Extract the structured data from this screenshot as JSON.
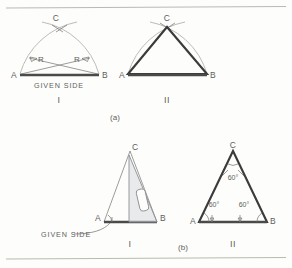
{
  "figure": {
    "title_part_a": "(a)",
    "title_part_b": "(b)",
    "panels": [
      {
        "id": "a-I",
        "roman": "I",
        "points": {
          "a": "A",
          "b": "B",
          "c": "C"
        },
        "radius_left": "R",
        "radius_right": "R",
        "caption": "GIVEN  SIDE"
      },
      {
        "id": "a-II",
        "roman": "II",
        "points": {
          "a": "A",
          "b": "B",
          "c": "C"
        }
      },
      {
        "id": "b-I",
        "roman": "I",
        "points": {
          "a": "A",
          "b": "B",
          "c": "C"
        },
        "caption": "GIVEN  SIDE"
      },
      {
        "id": "b-II",
        "roman": "II",
        "points": {
          "a": "A",
          "b": "B",
          "c": "C"
        },
        "angles": [
          "60°",
          "60°",
          "60°"
        ]
      }
    ]
  },
  "colors": {
    "paper": "#fdfdfb",
    "bold_line": "#3b3b3b",
    "thin_line": "#7c7c79",
    "arc_line": "#a9a9a6",
    "text": "#5e5e5e",
    "tool_fill": "#d9dade",
    "tool_edge": "#8d8f94",
    "rule": "#b9b9b5"
  }
}
